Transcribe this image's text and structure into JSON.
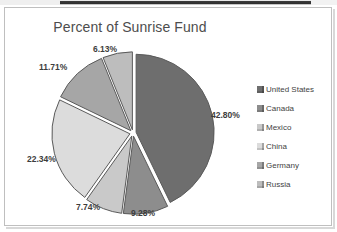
{
  "window": {
    "chart_border_color": "#bfbfbf",
    "background": "#ffffff"
  },
  "chart_data": {
    "type": "pie",
    "title": "Percent of Sunrise Fund",
    "xlabel": "",
    "ylabel": "",
    "legend_position": "right",
    "grid": false,
    "categories": [
      "United States",
      "Canada",
      "Mexico",
      "China",
      "Germany",
      "Russia"
    ],
    "values": [
      42.8,
      9.28,
      7.74,
      22.34,
      11.71,
      6.13
    ],
    "labels": [
      "42.80%",
      "9.28%",
      "7.74%",
      "22.34%",
      "11.71%",
      "6.13%"
    ],
    "colors": [
      "#6e6e6e",
      "#8d8d8d",
      "#c9c9c9",
      "#dcdcdc",
      "#a6a6a6",
      "#bdbdbd"
    ],
    "slice_edge_color": "#5a5a5a",
    "start_angle_deg": 0,
    "direction": "clockwise",
    "exploded": true
  },
  "legend": {
    "items": [
      {
        "label": "United States",
        "color": "#6e6e6e",
        "icon": "legend-swatch-icon"
      },
      {
        "label": "Canada",
        "color": "#8d8d8d",
        "icon": "legend-swatch-icon"
      },
      {
        "label": "Mexico",
        "color": "#c9c9c9",
        "icon": "legend-swatch-icon"
      },
      {
        "label": "China",
        "color": "#dcdcdc",
        "icon": "legend-swatch-icon"
      },
      {
        "label": "Germany",
        "color": "#a6a6a6",
        "icon": "legend-swatch-icon"
      },
      {
        "label": "Russia",
        "color": "#bdbdbd",
        "icon": "legend-swatch-icon"
      }
    ]
  }
}
